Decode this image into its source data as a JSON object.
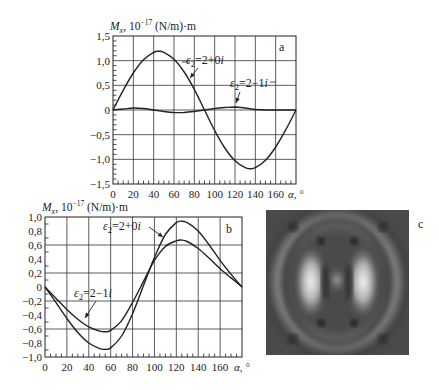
{
  "chart_data": [
    {
      "panel": "a",
      "type": "line",
      "ylabel_main": "M",
      "ylabel_sub": "x",
      "ylabel_rest": ", 10",
      "ylabel_exp": "−17",
      "ylabel_units": " (N/m)·m",
      "xlabel": "α, °",
      "xlim": [
        0,
        180
      ],
      "ylim": [
        -1.5,
        1.5
      ],
      "xticks": [
        0,
        20,
        40,
        60,
        80,
        100,
        120,
        140,
        160
      ],
      "xtick_labels": [
        "0",
        "20",
        "40",
        "60",
        "80",
        "100",
        "120",
        "140",
        "160"
      ],
      "yticks": [
        1.5,
        1.0,
        0.5,
        0,
        -0.5,
        -1.0,
        -1.5
      ],
      "ytick_labels": [
        "1,5",
        "1,0",
        "0,5",
        "0",
        "−0,5",
        "−1,0",
        "−1,5"
      ],
      "grid": true,
      "series": [
        {
          "name": "ε2=2+0i",
          "label_main": "ε",
          "label_sub": "2",
          "label_rest": "=2+0i",
          "x": [
            0,
            10,
            20,
            30,
            40,
            45,
            50,
            60,
            70,
            80,
            90,
            100,
            110,
            120,
            130,
            135,
            140,
            150,
            160,
            170,
            180
          ],
          "values": [
            0,
            0.4,
            0.75,
            1.02,
            1.17,
            1.19,
            1.17,
            1.03,
            0.77,
            0.42,
            0.0,
            -0.42,
            -0.77,
            -1.03,
            -1.17,
            -1.19,
            -1.17,
            -1.02,
            -0.75,
            -0.4,
            0
          ]
        },
        {
          "name": "ε2=2−1i",
          "label_main": "ε",
          "label_sub": "2",
          "label_rest": "=2−1i",
          "x": [
            0,
            10,
            20,
            30,
            40,
            50,
            60,
            70,
            80,
            90,
            100,
            110,
            120,
            130,
            140,
            150,
            160,
            170,
            180
          ],
          "values": [
            0,
            0.02,
            0.04,
            0.03,
            0.0,
            -0.03,
            -0.05,
            -0.05,
            -0.03,
            0.0,
            0.03,
            0.05,
            0.06,
            0.04,
            0.01,
            0.0,
            0.0,
            0.0,
            0
          ]
        }
      ]
    },
    {
      "panel": "b",
      "type": "line",
      "ylabel_main": "M",
      "ylabel_sub": "x",
      "ylabel_rest": ", 10",
      "ylabel_exp": "−17",
      "ylabel_units": " (N/m)·m",
      "xlabel": "α, °",
      "xlim": [
        0,
        180
      ],
      "ylim": [
        -1.0,
        1.0
      ],
      "xticks": [
        0,
        20,
        40,
        60,
        80,
        100,
        120,
        140,
        160
      ],
      "xtick_labels": [
        "0",
        "20",
        "40",
        "60",
        "80",
        "100",
        "120",
        "140",
        "160"
      ],
      "yticks": [
        1.0,
        0.8,
        0.6,
        0.4,
        0.2,
        0,
        -0.2,
        -0.4,
        -0.6,
        -0.8,
        -1.0
      ],
      "ytick_labels": [
        "1,0",
        "0,8",
        "0,6",
        "0,4",
        "0,2",
        "0",
        "−0,2",
        "−0,4",
        "−0,6",
        "−0,8",
        "−1,0"
      ],
      "grid": true,
      "series": [
        {
          "name": "ε2=2+0i",
          "label_main": "ε",
          "label_sub": "2",
          "label_rest": "=2+0i",
          "x": [
            0,
            10,
            20,
            30,
            40,
            50,
            55,
            60,
            70,
            80,
            90,
            100,
            110,
            120,
            125,
            130,
            140,
            150,
            160,
            170,
            180
          ],
          "values": [
            0,
            -0.22,
            -0.45,
            -0.65,
            -0.8,
            -0.88,
            -0.89,
            -0.87,
            -0.7,
            -0.38,
            0.02,
            0.42,
            0.75,
            0.92,
            0.94,
            0.92,
            0.8,
            0.6,
            0.38,
            0.18,
            0.0
          ]
        },
        {
          "name": "ε2=2−1i",
          "label_main": "ε",
          "label_sub": "2",
          "label_rest": "=2−1i",
          "x": [
            0,
            10,
            20,
            30,
            40,
            50,
            55,
            60,
            70,
            80,
            90,
            100,
            110,
            120,
            125,
            130,
            140,
            150,
            160,
            170,
            180
          ],
          "values": [
            0,
            -0.16,
            -0.32,
            -0.46,
            -0.57,
            -0.63,
            -0.64,
            -0.62,
            -0.48,
            -0.22,
            0.08,
            0.38,
            0.58,
            0.66,
            0.67,
            0.65,
            0.55,
            0.41,
            0.26,
            0.13,
            0.0
          ]
        }
      ]
    }
  ],
  "panel_c": {
    "letter": "c",
    "description": "grayscale interference pattern"
  },
  "panels": {
    "a_letter": "a",
    "b_letter": "b",
    "c_letter": "c"
  }
}
